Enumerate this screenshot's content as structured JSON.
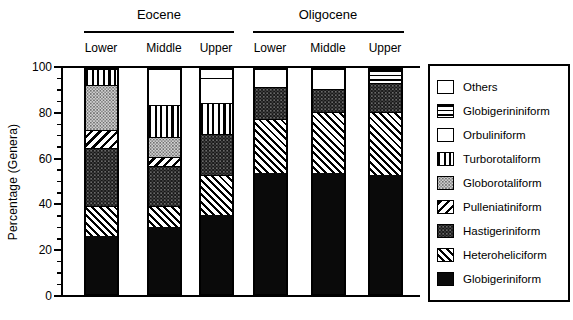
{
  "colors": {
    "ink": "#000000",
    "paper": "#ffffff"
  },
  "figure": {
    "ylabel": "Percentage (Genera)",
    "epochs": [
      {
        "label": "Eocene"
      },
      {
        "label": "Oligocene"
      }
    ],
    "column_labels": [
      "Lower",
      "Middle",
      "Upper",
      "Lower",
      "Middle",
      "Upper"
    ]
  },
  "chart_data": {
    "type": "bar",
    "stacked": true,
    "title": "",
    "xlabel": "",
    "ylabel": "Percentage (Genera)",
    "ylim": [
      0,
      100
    ],
    "yticks": [
      0,
      20,
      40,
      60,
      80,
      100
    ],
    "minor_tick_step": 5,
    "grid": false,
    "legend_position": "right",
    "group_labels": [
      "Eocene",
      "Oligocene"
    ],
    "categories": [
      "Eocene Lower",
      "Eocene Middle",
      "Eocene Upper",
      "Oligocene Lower",
      "Oligocene Middle",
      "Oligocene Upper"
    ],
    "category_tick_labels": [
      "Lower",
      "Middle",
      "Upper",
      "Lower",
      "Middle",
      "Upper"
    ],
    "series_bottom_to_top": [
      {
        "name": "Globigeriniform",
        "pattern": "solid-black",
        "values": [
          26,
          30,
          35,
          54,
          54,
          53
        ]
      },
      {
        "name": "Heteroheliciform",
        "pattern": "diagonal-forward",
        "values": [
          13,
          9,
          18,
          24,
          27,
          28
        ]
      },
      {
        "name": "Hastigeriniform",
        "pattern": "dark-stipple",
        "values": [
          26,
          18,
          18,
          14,
          10,
          13
        ]
      },
      {
        "name": "Pulleniatiniform",
        "pattern": "diagonal-back",
        "values": [
          8,
          4,
          0,
          0,
          0,
          0
        ]
      },
      {
        "name": "Globorotaliform",
        "pattern": "light-stipple",
        "values": [
          20,
          9,
          0,
          0,
          0,
          0
        ]
      },
      {
        "name": "Turborotaliform",
        "pattern": "vertical-stripes",
        "values": [
          7,
          14,
          14,
          0,
          0,
          0
        ]
      },
      {
        "name": "Orbuliniform",
        "pattern": "white",
        "values": [
          0,
          16,
          11,
          0,
          0,
          0
        ]
      },
      {
        "name": "Globigerininiform",
        "pattern": "horizontal-stripes",
        "values": [
          0,
          0,
          0,
          0,
          0,
          6
        ]
      },
      {
        "name": "Others",
        "pattern": "white",
        "values": [
          0,
          0,
          4,
          8,
          9,
          0
        ]
      }
    ],
    "legend_top_to_bottom": [
      "Others",
      "Globigerininiform",
      "Orbuliniform",
      "Turborotaliform",
      "Globorotaliform",
      "Pulleniatiniform",
      "Hastigeriniform",
      "Heteroheliciform",
      "Globigeriniform"
    ]
  }
}
